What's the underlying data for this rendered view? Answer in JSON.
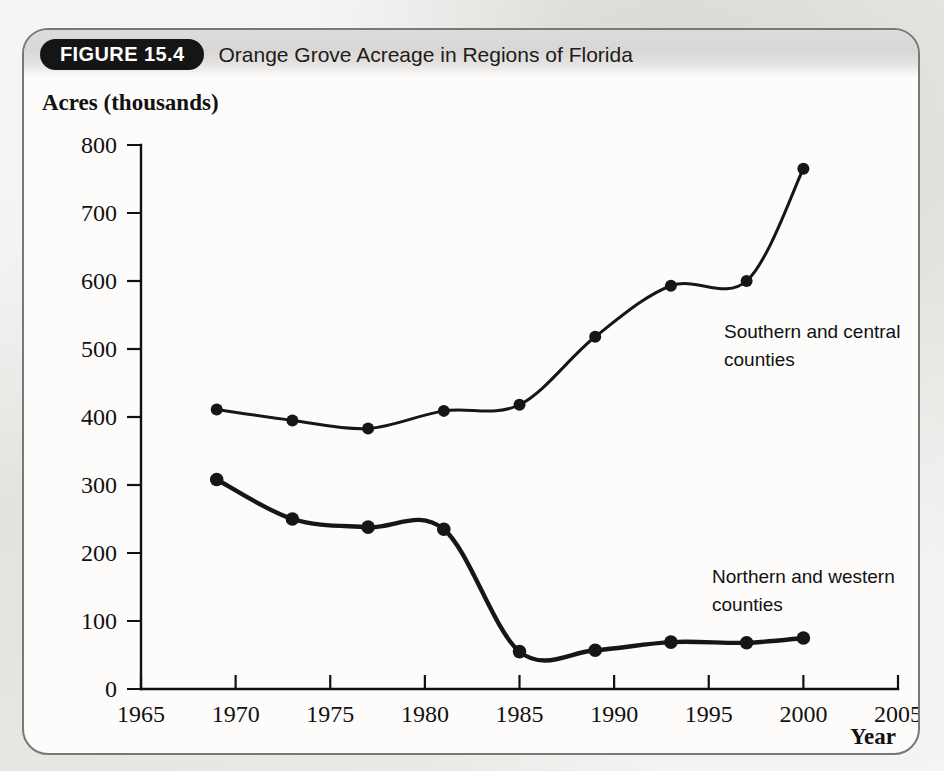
{
  "figure": {
    "badge": "FIGURE 15.4",
    "title": "Orange Grove Acreage in Regions of Florida"
  },
  "chart_data": {
    "type": "line",
    "title": "Orange Grove Acreage in Regions of Florida",
    "xlabel": "Year",
    "ylabel": "Acres (thousands)",
    "xlim": [
      1965,
      2005
    ],
    "ylim": [
      0,
      800
    ],
    "grid": false,
    "legend_position": "inline-right",
    "x_ticks": [
      "1965",
      "1970",
      "1975",
      "1980",
      "1985",
      "1990",
      "1995",
      "2000",
      "2005"
    ],
    "y_ticks": [
      "0",
      "100",
      "200",
      "300",
      "400",
      "500",
      "600",
      "700",
      "800"
    ],
    "x": [
      1969,
      1973,
      1977,
      1981,
      1985,
      1989,
      1993,
      1997,
      2000
    ],
    "series": [
      {
        "name": "Southern and central counties",
        "label_line1": "Southern and central",
        "label_line2": "counties",
        "color": "#161616",
        "values": [
          411,
          395,
          383,
          409,
          418,
          518,
          593,
          600,
          765
        ]
      },
      {
        "name": "Northern and western counties",
        "label_line1": "Northern and western",
        "label_line2": "counties",
        "color": "#161616",
        "values": [
          308,
          250,
          238,
          235,
          55,
          57,
          69,
          68,
          75
        ]
      }
    ]
  },
  "colors": {
    "ink": "#161616",
    "card_bg": "#fdfcfb",
    "page_bg": "#e8e6e4",
    "badge_bg": "#151515",
    "badge_fg": "#ffffff"
  }
}
